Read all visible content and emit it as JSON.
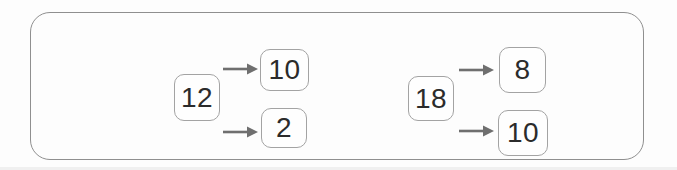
{
  "figure": {
    "type": "number-decomposition-diagram",
    "groups": [
      {
        "source": "12",
        "targets": [
          "10",
          "2"
        ]
      },
      {
        "source": "18",
        "targets": [
          "8",
          "10"
        ]
      }
    ]
  },
  "colors": {
    "frame_border": "#8f8f8f",
    "box_border": "#a3a3a3",
    "arrow": "#6f6f6f",
    "digit": "#2b2b2b",
    "background": "#fdfdfd"
  }
}
